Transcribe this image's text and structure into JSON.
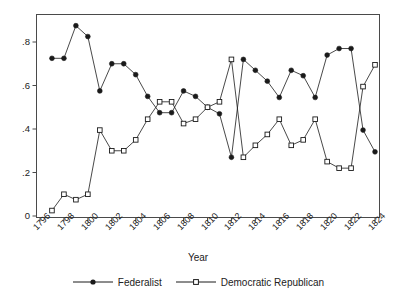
{
  "chart_data": {
    "type": "line",
    "title": "",
    "xlabel": "Year",
    "ylabel": "",
    "xlim": [
      1796,
      1824
    ],
    "ylim": [
      0,
      0.9
    ],
    "grid": false,
    "legend_position": "bottom",
    "x_tick_labels": [
      "1796",
      "1798",
      "1800",
      "1802",
      "1804",
      "1806",
      "1808",
      "1810",
      "1812",
      "1814",
      "1816",
      "1818",
      "1820",
      "1822",
      "1824"
    ],
    "x_tick_values": [
      1796,
      1798,
      1800,
      1802,
      1804,
      1806,
      1808,
      1810,
      1812,
      1814,
      1816,
      1818,
      1820,
      1822,
      1824
    ],
    "y_tick_labels": [
      "0",
      ".2",
      ".4",
      ".6",
      ".8"
    ],
    "y_tick_values": [
      0,
      0.2,
      0.4,
      0.6,
      0.8
    ],
    "x": [
      1797,
      1798,
      1799,
      1800,
      1801,
      1802,
      1803,
      1804,
      1805,
      1806,
      1807,
      1808,
      1809,
      1810,
      1811,
      1812,
      1813,
      1814,
      1815,
      1816,
      1817,
      1818,
      1819,
      1820,
      1821,
      1822,
      1823,
      1824
    ],
    "series": [
      {
        "name": "Federalist",
        "marker": "filled-circle",
        "color": "#1a1a1a",
        "values": [
          0.725,
          0.725,
          0.875,
          0.825,
          0.575,
          0.7,
          0.7,
          0.65,
          0.55,
          0.475,
          0.475,
          0.575,
          0.55,
          0.5,
          0.47,
          0.27,
          0.72,
          0.67,
          0.62,
          0.545,
          0.67,
          0.645,
          0.545,
          0.74,
          0.77,
          0.77,
          0.395,
          0.295
        ]
      },
      {
        "name": "Democratic Republican",
        "marker": "open-square",
        "color": "#1a1a1a",
        "values": [
          0.025,
          0.1,
          0.075,
          0.1,
          0.395,
          0.3,
          0.3,
          0.35,
          0.445,
          0.525,
          0.525,
          0.425,
          0.445,
          0.5,
          0.525,
          0.72,
          0.27,
          0.325,
          0.375,
          0.445,
          0.325,
          0.35,
          0.445,
          0.25,
          0.22,
          0.22,
          0.595,
          0.695
        ]
      }
    ]
  },
  "legend": {
    "entries": [
      {
        "label": "Federalist",
        "marker": "filled-circle"
      },
      {
        "label": "Democratic Republican",
        "marker": "open-square"
      }
    ]
  },
  "axes": {
    "x_title": "Year"
  }
}
